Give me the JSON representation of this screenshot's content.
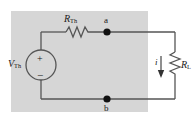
{
  "diagram": {
    "background_color": "#ffffff",
    "panel_color": "#d6d6d6",
    "wire_color": "#555555",
    "text_color": "#1a1a1a"
  },
  "labels": {
    "source_symbol": "V",
    "source_subscript": "Th",
    "series_resistor_symbol": "R",
    "series_resistor_subscript": "Th",
    "load_resistor_symbol": "R",
    "load_resistor_subscript": "L",
    "current_symbol": "i",
    "node_a": "a",
    "node_b": "b",
    "polarity_plus": "+",
    "polarity_minus": "−"
  },
  "components": [
    {
      "name": "voltage-source",
      "type": "independent-voltage-source",
      "label": "V_Th",
      "orientation": "vertical",
      "polarity_top": "+",
      "polarity_bottom": "-"
    },
    {
      "name": "series-resistor",
      "type": "resistor",
      "label": "R_Th",
      "orientation": "horizontal"
    },
    {
      "name": "load-resistor",
      "type": "resistor",
      "label": "R_L",
      "orientation": "vertical"
    },
    {
      "name": "terminal-a",
      "type": "node-dot",
      "label": "a"
    },
    {
      "name": "terminal-b",
      "type": "node-dot",
      "label": "b"
    },
    {
      "name": "load-current",
      "type": "current-arrow",
      "label": "i",
      "direction": "down"
    }
  ]
}
